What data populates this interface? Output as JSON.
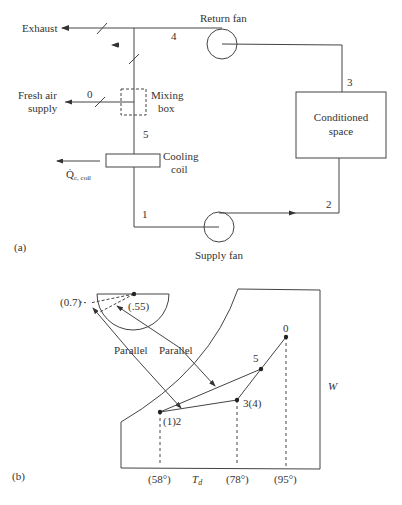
{
  "figure_a": {
    "panel_label": "(a)",
    "components": {
      "exhaust": "Exhaust",
      "return_fan": "Return fan",
      "fresh_air_line1": "Fresh air",
      "fresh_air_line2": "supply",
      "mixing_box_line1": "Mixing",
      "mixing_box_line2": "box",
      "cooling_coil_line1": "Cooling",
      "cooling_coil_line2": "coil",
      "conditioned_space_line1": "Conditioned",
      "conditioned_space_line2": "space",
      "supply_fan": "Supply fan",
      "heat_removed_symbol": "Q̇",
      "heat_removed_subscript": "c, coil"
    },
    "state_points": {
      "p0": "0",
      "p1": "1",
      "p2": "2",
      "p3": "3",
      "p4": "4",
      "p5": "5"
    }
  },
  "figure_b": {
    "panel_label": "(b)",
    "protractor": {
      "shr_outer": "(0.7)",
      "shr_inner": "(.55)"
    },
    "annotations": {
      "parallel_left": "Parallel",
      "parallel_right": "Parallel"
    },
    "axes": {
      "x_label": "T",
      "x_label_sub": "d",
      "y_label": "W"
    },
    "state_points": {
      "p0": "0",
      "p5": "5",
      "p34": "3(4)",
      "p12": "(1)2"
    },
    "temperature_ticks": {
      "t1": "(58°)",
      "t2": "(78°)",
      "t3": "(95°)"
    }
  }
}
